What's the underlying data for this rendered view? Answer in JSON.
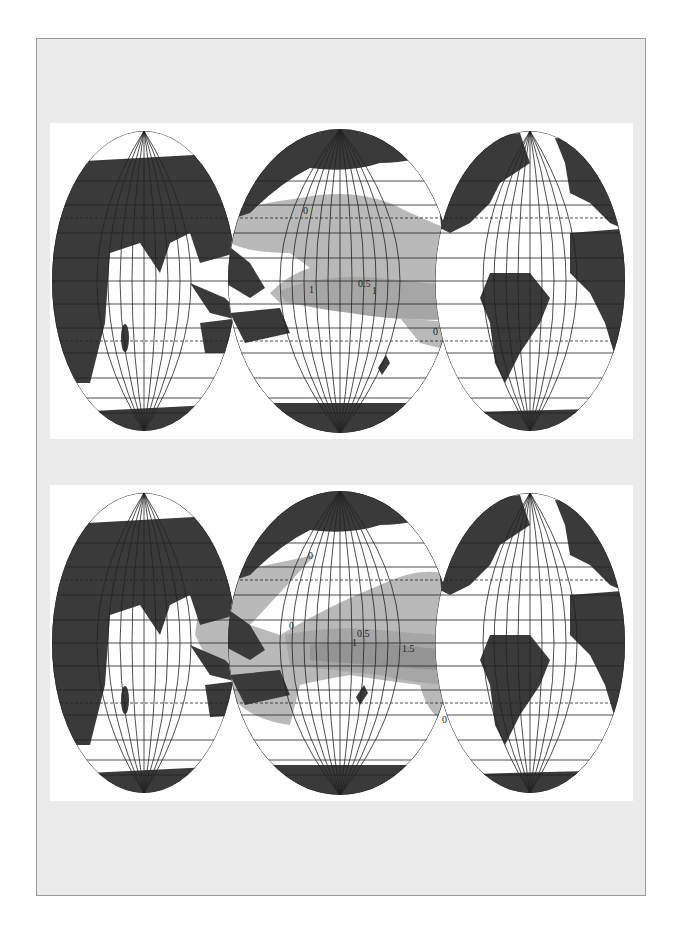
{
  "figure": {
    "panels": [
      {
        "id": "top",
        "contour_labels": [
          {
            "text": "0",
            "x": 253,
            "y": 91
          },
          {
            "text": "0.5",
            "x": 308,
            "y": 164
          },
          {
            "text": "1",
            "x": 259,
            "y": 170
          },
          {
            "text": "1",
            "x": 322,
            "y": 171
          },
          {
            "text": "0",
            "x": 383,
            "y": 212
          }
        ]
      },
      {
        "id": "bottom",
        "contour_labels": [
          {
            "text": "0",
            "x": 258,
            "y": 74
          },
          {
            "text": "0",
            "x": 239,
            "y": 144
          },
          {
            "text": "0.5",
            "x": 307,
            "y": 152
          },
          {
            "text": "1",
            "x": 302,
            "y": 161
          },
          {
            "text": "1.5",
            "x": 352,
            "y": 167
          },
          {
            "text": "0",
            "x": 392,
            "y": 238
          }
        ]
      }
    ],
    "colors": {
      "land": "#3a3a3a",
      "shade_light": "#b9b9b9",
      "shade_mid": "#a6a6a6",
      "shade_dark": "#949494",
      "grid": "#222222",
      "frame_bg": "#ebebeb"
    }
  }
}
